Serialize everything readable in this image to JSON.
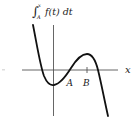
{
  "diagram": {
    "title": {
      "integral_sign": "∫",
      "upper_limit": "x",
      "lower_limit": "A",
      "integrand": "f(t) dt"
    },
    "axis_labels": {
      "x": "x"
    },
    "points": [
      {
        "label": "A",
        "x_px": 70
      },
      {
        "label": "B",
        "x_px": 87
      }
    ],
    "colors": {
      "curve": "#111111",
      "axes": "#555555"
    }
  }
}
